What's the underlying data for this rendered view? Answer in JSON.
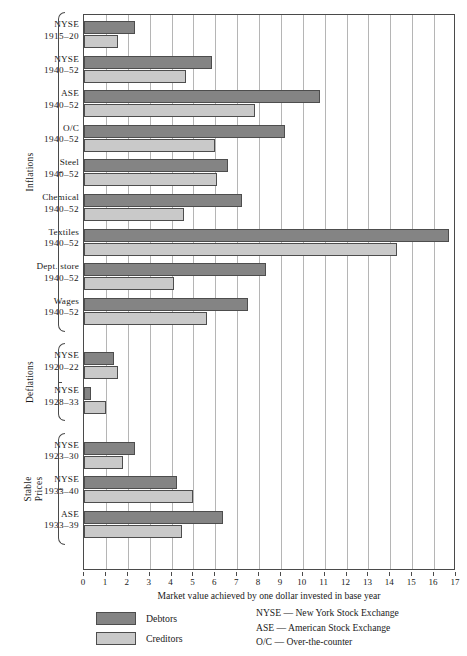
{
  "chart_data": {
    "type": "bar",
    "orientation": "horizontal",
    "title": "",
    "xlabel": "Market value achieved by one dollar invested in base year",
    "ylabel": "",
    "xlim": [
      0,
      17
    ],
    "xticks": [
      0,
      1,
      2,
      3,
      4,
      5,
      6,
      7,
      8,
      9,
      10,
      11,
      12,
      13,
      14,
      15,
      16,
      17
    ],
    "grid": true,
    "legend_position": "bottom-left",
    "series": [
      {
        "name": "Debtors",
        "color": "#848484",
        "values": [
          2.35,
          5.85,
          10.8,
          9.2,
          6.6,
          7.2,
          16.7,
          8.3,
          7.5,
          1.35,
          0.3,
          2.35,
          4.25,
          6.35
        ]
      },
      {
        "name": "Creditors",
        "color": "#c9c9c9",
        "values": [
          1.55,
          4.65,
          7.8,
          6.0,
          6.1,
          4.55,
          14.3,
          4.1,
          5.6,
          1.55,
          1.0,
          1.8,
          5.0,
          4.5
        ]
      }
    ],
    "categories": [
      "NYSE 1915–20",
      "NYSE 1940–52",
      "ASE 1940–52",
      "O/C 1940–52",
      "Steel 1940–52",
      "Chemical 1940–52",
      "Textiles 1940–52",
      "Dept. store 1940–52",
      "Wages 1940–52",
      "NYSE 1920–22",
      "NYSE 1928–33",
      "NYSE 1923–30",
      "NYSE 1933–40",
      "ASE 1933–39"
    ],
    "groups": [
      {
        "label": "Inflations",
        "rows": 9
      },
      {
        "label": "Deflations",
        "rows": 2
      },
      {
        "label": "Stable\nPrices",
        "rows": 3
      }
    ]
  },
  "rows": [
    {
      "name": "NYSE",
      "period": "1915–20",
      "debtors": 2.35,
      "creditors": 1.55
    },
    {
      "name": "NYSE",
      "period": "1940–52",
      "debtors": 5.85,
      "creditors": 4.65
    },
    {
      "name": "ASE",
      "period": "1940–52",
      "debtors": 10.8,
      "creditors": 7.8
    },
    {
      "name": "O/C",
      "period": "1940–52",
      "debtors": 9.2,
      "creditors": 6.0
    },
    {
      "name": "Steel",
      "period": "1940–52",
      "debtors": 6.6,
      "creditors": 6.1
    },
    {
      "name": "Chemical",
      "period": "1940–52",
      "debtors": 7.2,
      "creditors": 4.55
    },
    {
      "name": "Textiles",
      "period": "1940–52",
      "debtors": 16.7,
      "creditors": 14.3
    },
    {
      "name": "Dept. store",
      "period": "1940–52",
      "debtors": 8.3,
      "creditors": 4.1
    },
    {
      "name": "Wages",
      "period": "1940–52",
      "debtors": 7.5,
      "creditors": 5.6
    },
    {
      "name": "NYSE",
      "period": "1920–22",
      "debtors": 1.35,
      "creditors": 1.55
    },
    {
      "name": "NYSE",
      "period": "1928–33",
      "debtors": 0.3,
      "creditors": 1.0
    },
    {
      "name": "NYSE",
      "period": "1923–30",
      "debtors": 2.35,
      "creditors": 1.8
    },
    {
      "name": "NYSE",
      "period": "1933–40",
      "debtors": 4.25,
      "creditors": 5.0
    },
    {
      "name": "ASE",
      "period": "1933–39",
      "debtors": 6.35,
      "creditors": 4.5
    }
  ],
  "groups": [
    {
      "label": "Inflations",
      "label_line1": "Inflations",
      "label_line2": "",
      "start": 0,
      "count": 9
    },
    {
      "label": "Deflations",
      "label_line1": "Deflations",
      "label_line2": "",
      "start": 9,
      "count": 2
    },
    {
      "label": "Stable Prices",
      "label_line1": "Stable",
      "label_line2": "Prices",
      "start": 11,
      "count": 3
    }
  ],
  "axis": {
    "title": "Market value achieved by one dollar invested in base year",
    "ticks": [
      "0",
      "1",
      "2",
      "3",
      "4",
      "5",
      "6",
      "7",
      "8",
      "9",
      "10",
      "11",
      "12",
      "13",
      "14",
      "15",
      "16",
      "17"
    ],
    "min": 0,
    "max": 17
  },
  "legend": {
    "debtors_label": "Debtors",
    "creditors_label": "Creditors",
    "debtors_color": "#848484",
    "creditors_color": "#c9c9c9"
  },
  "notes": [
    "NYSE — New York Stock Exchange",
    "ASE — American Stock Exchange",
    "O/C — Over-the-counter"
  ]
}
